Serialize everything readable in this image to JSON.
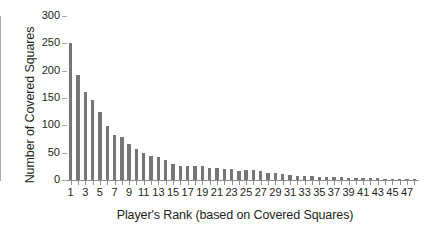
{
  "chart_data": {
    "type": "bar",
    "title": "",
    "subtitle": "",
    "xlabel": "Player's Rank (based on Covered Squares)",
    "ylabel": "Number of Covered Squares",
    "xlim": [
      0.5,
      48.5
    ],
    "ylim": [
      0,
      300
    ],
    "ytick_values": [
      0,
      50,
      100,
      150,
      200,
      250,
      300
    ],
    "ytick_labels": [
      "0",
      "50",
      "100",
      "150",
      "200",
      "250",
      "300"
    ],
    "xtick_values": [
      1,
      3,
      5,
      7,
      9,
      11,
      13,
      15,
      17,
      19,
      21,
      23,
      25,
      27,
      29,
      31,
      33,
      35,
      37,
      39,
      41,
      43,
      45,
      47
    ],
    "xtick_labels": [
      "1",
      "3",
      "5",
      "7",
      "9",
      "11",
      "13",
      "15",
      "17",
      "19",
      "21",
      "23",
      "25",
      "27",
      "29",
      "31",
      "33",
      "35",
      "37",
      "39",
      "41",
      "43",
      "45",
      "47"
    ],
    "grid": false,
    "legend": null,
    "bar_color": "#767676",
    "axis_color": "#8d8d8d",
    "background": "#ffffff",
    "categories": [
      1,
      2,
      3,
      4,
      5,
      6,
      7,
      8,
      9,
      10,
      11,
      12,
      13,
      14,
      15,
      16,
      17,
      18,
      19,
      20,
      21,
      22,
      23,
      24,
      25,
      26,
      27,
      28,
      29,
      30,
      31,
      32,
      33,
      34,
      35,
      36,
      37,
      38,
      39,
      40,
      41,
      42,
      43,
      44,
      45,
      46,
      47,
      48
    ],
    "values": [
      250,
      192,
      161,
      146,
      124,
      99,
      82,
      79,
      66,
      57,
      49,
      44,
      43,
      36,
      30,
      26,
      26,
      26,
      25,
      22,
      22,
      21,
      21,
      17,
      18,
      18,
      17,
      13,
      12,
      11,
      9,
      8,
      7,
      7,
      6,
      6,
      5,
      5,
      4,
      4,
      3,
      3,
      3,
      2,
      2,
      2,
      1,
      1
    ]
  }
}
